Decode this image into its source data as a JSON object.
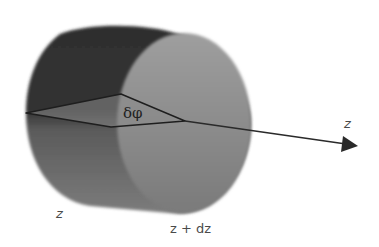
{
  "figure": {
    "type": "cylinder-element-diagram"
  },
  "labels": {
    "angle": "δφ",
    "axis": "z",
    "left_face": "z",
    "right_face": "z + dz"
  },
  "colors": {
    "background": "#ffffff",
    "body_dark": "#3a3a3a",
    "body_mid": "#6e6e6e",
    "end_cap": "#8c8c8c",
    "wedge_fill": "#9a9a9a",
    "lines": "#1e1e1e",
    "label_text": "#4a4a4a"
  }
}
